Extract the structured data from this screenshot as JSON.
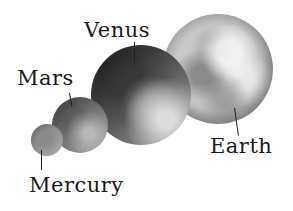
{
  "diagram": {
    "title": "",
    "planets": [
      {
        "name": "Mercury",
        "label": "Mercury",
        "shade": "#9e9e9e"
      },
      {
        "name": "Mars",
        "label": "Mars",
        "shade": "#7a7a7a"
      },
      {
        "name": "Venus",
        "label": "Venus",
        "shade": "#555555"
      },
      {
        "name": "Earth",
        "label": "Earth",
        "shade": "#c8c8c8"
      }
    ]
  }
}
